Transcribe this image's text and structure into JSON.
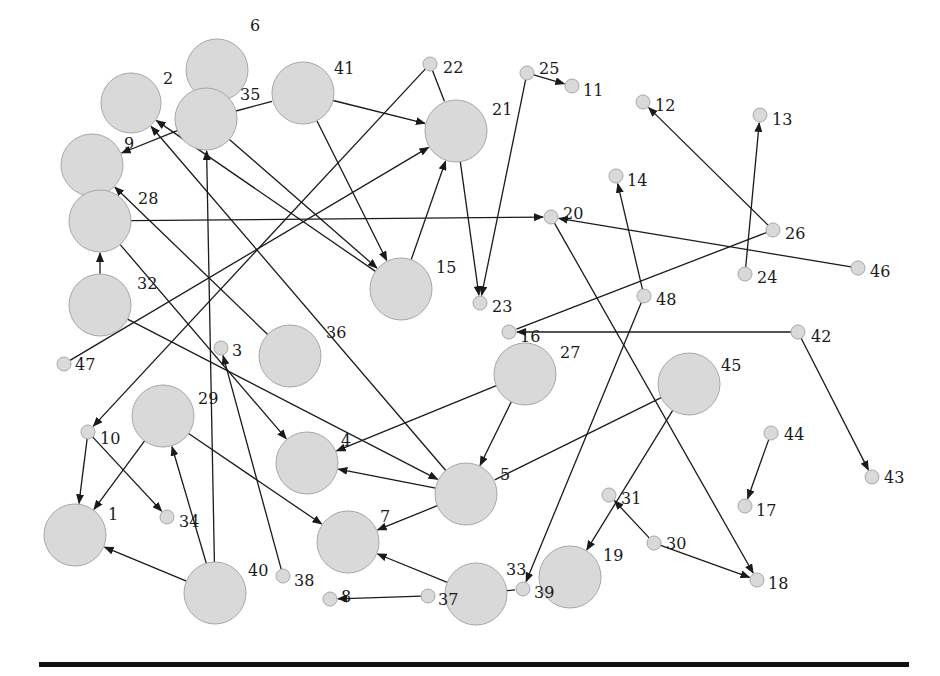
{
  "diagram": {
    "type": "directed-graph",
    "node_fill": "#d9d9d9",
    "node_stroke": "#a8a8a8",
    "edge_color": "#1a1a1a",
    "nodes": [
      {
        "id": "1",
        "x": 75,
        "y": 535,
        "r": 31,
        "lx": 108,
        "ly": 514
      },
      {
        "id": "2",
        "x": 131,
        "y": 103,
        "r": 30,
        "lx": 163,
        "ly": 78
      },
      {
        "id": "3",
        "x": 221,
        "y": 348,
        "r": 7,
        "lx": 232,
        "ly": 350
      },
      {
        "id": "4",
        "x": 307,
        "y": 463,
        "r": 31,
        "lx": 341,
        "ly": 440
      },
      {
        "id": "5",
        "x": 466,
        "y": 494,
        "r": 31,
        "lx": 500,
        "ly": 474
      },
      {
        "id": "6",
        "x": 217,
        "y": 70,
        "r": 31,
        "lx": 250,
        "ly": 25
      },
      {
        "id": "7",
        "x": 348,
        "y": 542,
        "r": 31,
        "lx": 380,
        "ly": 516
      },
      {
        "id": "8",
        "x": 330,
        "y": 599,
        "r": 7,
        "lx": 341,
        "ly": 596
      },
      {
        "id": "9",
        "x": 92,
        "y": 165,
        "r": 31,
        "lx": 124,
        "ly": 143
      },
      {
        "id": "10",
        "x": 88,
        "y": 432,
        "r": 7,
        "lx": 100,
        "ly": 438
      },
      {
        "id": "11",
        "x": 572,
        "y": 86,
        "r": 7,
        "lx": 583,
        "ly": 90
      },
      {
        "id": "12",
        "x": 643,
        "y": 102,
        "r": 7,
        "lx": 655,
        "ly": 105
      },
      {
        "id": "13",
        "x": 760,
        "y": 115,
        "r": 7,
        "lx": 772,
        "ly": 119
      },
      {
        "id": "14",
        "x": 616,
        "y": 176,
        "r": 7,
        "lx": 627,
        "ly": 180
      },
      {
        "id": "15",
        "x": 401,
        "y": 289,
        "r": 31,
        "lx": 436,
        "ly": 267
      },
      {
        "id": "16",
        "x": 509,
        "y": 332,
        "r": 7,
        "lx": 520,
        "ly": 336
      },
      {
        "id": "17",
        "x": 745,
        "y": 506,
        "r": 7,
        "lx": 756,
        "ly": 510
      },
      {
        "id": "18",
        "x": 757,
        "y": 580,
        "r": 7,
        "lx": 768,
        "ly": 583
      },
      {
        "id": "19",
        "x": 570,
        "y": 577,
        "r": 31,
        "lx": 603,
        "ly": 555
      },
      {
        "id": "20",
        "x": 551,
        "y": 217,
        "r": 7,
        "lx": 563,
        "ly": 213
      },
      {
        "id": "21",
        "x": 456,
        "y": 131,
        "r": 31,
        "lx": 492,
        "ly": 109
      },
      {
        "id": "22",
        "x": 430,
        "y": 64,
        "r": 7,
        "lx": 443,
        "ly": 67
      },
      {
        "id": "23",
        "x": 480,
        "y": 303,
        "r": 7,
        "lx": 492,
        "ly": 306
      },
      {
        "id": "24",
        "x": 745,
        "y": 274,
        "r": 7,
        "lx": 757,
        "ly": 277
      },
      {
        "id": "25",
        "x": 527,
        "y": 73,
        "r": 7,
        "lx": 539,
        "ly": 68
      },
      {
        "id": "26",
        "x": 773,
        "y": 230,
        "r": 7,
        "lx": 785,
        "ly": 233
      },
      {
        "id": "27",
        "x": 525,
        "y": 374,
        "r": 31,
        "lx": 560,
        "ly": 352
      },
      {
        "id": "28",
        "x": 100,
        "y": 221,
        "r": 31,
        "lx": 138,
        "ly": 198
      },
      {
        "id": "29",
        "x": 163,
        "y": 416,
        "r": 31,
        "lx": 198,
        "ly": 398
      },
      {
        "id": "30",
        "x": 654,
        "y": 543,
        "r": 7,
        "lx": 666,
        "ly": 543
      },
      {
        "id": "31",
        "x": 609,
        "y": 495,
        "r": 7,
        "lx": 621,
        "ly": 498
      },
      {
        "id": "32",
        "x": 100,
        "y": 305,
        "r": 31,
        "lx": 137,
        "ly": 283
      },
      {
        "id": "33",
        "x": 476,
        "y": 594,
        "r": 31,
        "lx": 506,
        "ly": 569
      },
      {
        "id": "34",
        "x": 167,
        "y": 517,
        "r": 7,
        "lx": 179,
        "ly": 521
      },
      {
        "id": "35",
        "x": 206,
        "y": 119,
        "r": 31,
        "lx": 240,
        "ly": 94
      },
      {
        "id": "36",
        "x": 290,
        "y": 356,
        "r": 31,
        "lx": 326,
        "ly": 332
      },
      {
        "id": "37",
        "x": 428,
        "y": 596,
        "r": 7,
        "lx": 438,
        "ly": 599
      },
      {
        "id": "38",
        "x": 283,
        "y": 576,
        "r": 7,
        "lx": 294,
        "ly": 580
      },
      {
        "id": "39",
        "x": 523,
        "y": 589,
        "r": 7,
        "lx": 534,
        "ly": 592
      },
      {
        "id": "40",
        "x": 215,
        "y": 593,
        "r": 31,
        "lx": 248,
        "ly": 570
      },
      {
        "id": "41",
        "x": 303,
        "y": 93,
        "r": 31,
        "lx": 334,
        "ly": 68
      },
      {
        "id": "42",
        "x": 798,
        "y": 332,
        "r": 7,
        "lx": 811,
        "ly": 336
      },
      {
        "id": "43",
        "x": 872,
        "y": 477,
        "r": 7,
        "lx": 884,
        "ly": 477
      },
      {
        "id": "44",
        "x": 771,
        "y": 433,
        "r": 7,
        "lx": 784,
        "ly": 434
      },
      {
        "id": "45",
        "x": 689,
        "y": 384,
        "r": 31,
        "lx": 721,
        "ly": 365
      },
      {
        "id": "46",
        "x": 858,
        "y": 268,
        "r": 7,
        "lx": 870,
        "ly": 271
      },
      {
        "id": "47",
        "x": 64,
        "y": 364,
        "r": 7,
        "lx": 75,
        "ly": 364
      },
      {
        "id": "48",
        "x": 644,
        "y": 296,
        "r": 7,
        "lx": 656,
        "ly": 299
      }
    ],
    "edges": [
      {
        "from": "25",
        "to": "11",
        "arrow": true
      },
      {
        "from": "25",
        "to": "23",
        "arrow": true
      },
      {
        "from": "21",
        "to": "23",
        "arrow": true
      },
      {
        "from": "22",
        "to": "21",
        "arrow": false
      },
      {
        "from": "22",
        "to": "10",
        "arrow": true
      },
      {
        "from": "41",
        "to": "21",
        "arrow": true
      },
      {
        "from": "41",
        "to": "15",
        "arrow": true
      },
      {
        "from": "35",
        "to": "15",
        "arrow": true
      },
      {
        "from": "35",
        "to": "41",
        "arrow": false
      },
      {
        "from": "35",
        "to": "9",
        "arrow": true
      },
      {
        "from": "15",
        "to": "21",
        "arrow": true
      },
      {
        "from": "15",
        "to": "2",
        "arrow": true
      },
      {
        "from": "47",
        "to": "21",
        "arrow": true
      },
      {
        "from": "28",
        "to": "20",
        "arrow": true
      },
      {
        "from": "32",
        "to": "28",
        "arrow": true
      },
      {
        "from": "32",
        "to": "5",
        "arrow": true
      },
      {
        "from": "36",
        "to": "9",
        "arrow": true
      },
      {
        "from": "5",
        "to": "2",
        "arrow": true
      },
      {
        "from": "40",
        "to": "35",
        "arrow": true
      },
      {
        "from": "28",
        "to": "4",
        "arrow": true
      },
      {
        "from": "26",
        "to": "12",
        "arrow": true
      },
      {
        "from": "24",
        "to": "13",
        "arrow": true
      },
      {
        "from": "46",
        "to": "20",
        "arrow": true
      },
      {
        "from": "26",
        "to": "16",
        "arrow": false
      },
      {
        "from": "48",
        "to": "14",
        "arrow": true
      },
      {
        "from": "48",
        "to": "39",
        "arrow": true
      },
      {
        "from": "20",
        "to": "18",
        "arrow": true
      },
      {
        "from": "42",
        "to": "16",
        "arrow": true
      },
      {
        "from": "42",
        "to": "43",
        "arrow": true
      },
      {
        "from": "27",
        "to": "4",
        "arrow": true
      },
      {
        "from": "27",
        "to": "5",
        "arrow": true
      },
      {
        "from": "45",
        "to": "5",
        "arrow": false
      },
      {
        "from": "45",
        "to": "19",
        "arrow": true
      },
      {
        "from": "30",
        "to": "31",
        "arrow": true
      },
      {
        "from": "30",
        "to": "18",
        "arrow": true
      },
      {
        "from": "44",
        "to": "17",
        "arrow": true
      },
      {
        "from": "5",
        "to": "4",
        "arrow": true
      },
      {
        "from": "5",
        "to": "7",
        "arrow": true
      },
      {
        "from": "29",
        "to": "7",
        "arrow": true
      },
      {
        "from": "29",
        "to": "1",
        "arrow": true
      },
      {
        "from": "10",
        "to": "1",
        "arrow": true
      },
      {
        "from": "10",
        "to": "34",
        "arrow": true
      },
      {
        "from": "40",
        "to": "29",
        "arrow": true
      },
      {
        "from": "40",
        "to": "1",
        "arrow": true
      },
      {
        "from": "38",
        "to": "3",
        "arrow": true
      },
      {
        "from": "33",
        "to": "7",
        "arrow": true
      },
      {
        "from": "37",
        "to": "8",
        "arrow": true
      },
      {
        "from": "33",
        "to": "39",
        "arrow": false
      }
    ]
  }
}
